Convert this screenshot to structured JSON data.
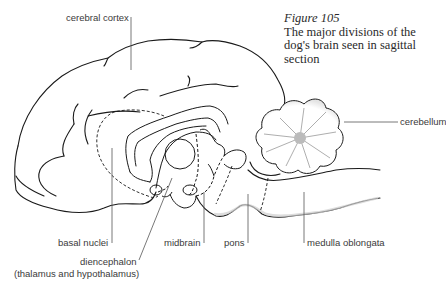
{
  "caption": {
    "figure_number": "Figure 105",
    "text": "The major divisions of the dog's brain seen in sagittal section"
  },
  "labels": {
    "cerebral_cortex": "cerebral cortex",
    "cerebellum": "cerebellum",
    "basal_nuclei": "basal nuclei",
    "midbrain": "midbrain",
    "pons": "pons",
    "medulla_oblongata": "medulla oblongata",
    "diencephalon": "diencephalon",
    "diencephalon_sub": "(thalamus and hypothalamus)"
  },
  "colors": {
    "line": "#1a1a1a",
    "leader": "#555555",
    "shading": "#d8d8d8"
  }
}
